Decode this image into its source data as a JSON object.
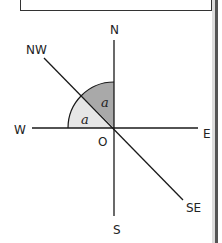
{
  "diagram": {
    "type": "compass-angle-diagram",
    "center_label": "O",
    "directions": {
      "north": "N",
      "south": "S",
      "east": "E",
      "west": "W",
      "northwest": "NW",
      "southeast": "SE"
    },
    "angles": [
      {
        "label": "a",
        "between": [
          "W",
          "NW"
        ],
        "fill": "#e6e6e6"
      },
      {
        "label": "a",
        "between": [
          "NW",
          "N"
        ],
        "fill": "#a9a9a9"
      }
    ],
    "colors": {
      "line": "#1a1a1a",
      "light_sector": "#e6e6e6",
      "dark_sector": "#a9a9a9"
    }
  }
}
